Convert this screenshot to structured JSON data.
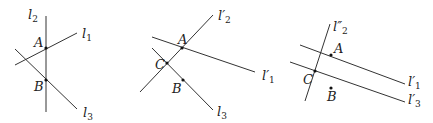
{
  "panels": [
    {
      "id": "panel-1",
      "lines": [
        {
          "name": "l2",
          "label": "l",
          "sub": "2",
          "prime": "",
          "x1": 46,
          "y1": 16,
          "x2": 46,
          "y2": 112,
          "lx": 28,
          "ly": 19
        },
        {
          "name": "l1",
          "label": "l",
          "sub": "1",
          "prime": "",
          "x1": 15,
          "y1": 65,
          "x2": 77,
          "y2": 33,
          "lx": 82,
          "ly": 38
        },
        {
          "name": "l3",
          "label": "l",
          "sub": "3",
          "prime": "",
          "x1": 15,
          "y1": 49,
          "x2": 77,
          "y2": 109,
          "lx": 83,
          "ly": 117
        }
      ],
      "points": [
        {
          "name": "A",
          "x": 46,
          "y": 48,
          "lx": 34,
          "ly": 47,
          "dot": true
        },
        {
          "name": "B",
          "x": 46,
          "y": 80,
          "lx": 34,
          "ly": 91,
          "dot": true
        }
      ]
    },
    {
      "id": "panel-2",
      "lines": [
        {
          "name": "l2-prime",
          "label": "l",
          "sub": "2",
          "prime": "′",
          "x1": 140,
          "y1": 92,
          "x2": 213,
          "y2": 15,
          "lx": 218,
          "ly": 20
        },
        {
          "name": "l1-prime",
          "label": "l",
          "sub": "1",
          "prime": "′",
          "x1": 152,
          "y1": 37,
          "x2": 255,
          "y2": 72,
          "lx": 262,
          "ly": 80
        },
        {
          "name": "l3",
          "label": "l",
          "sub": "3",
          "prime": "",
          "x1": 152,
          "y1": 48,
          "x2": 213,
          "y2": 110,
          "lx": 217,
          "ly": 116
        }
      ],
      "points": [
        {
          "name": "A",
          "x": 182,
          "y": 48,
          "lx": 178,
          "ly": 44,
          "dot": true
        },
        {
          "name": "C",
          "x": 167,
          "y": 63,
          "lx": 155,
          "ly": 69,
          "dot": true
        },
        {
          "name": "B",
          "x": 183,
          "y": 80,
          "lx": 172,
          "ly": 93,
          "dot": true
        }
      ]
    },
    {
      "id": "panel-3",
      "lines": [
        {
          "name": "l2-double-prime",
          "label": "l",
          "sub": "2",
          "prime": "″",
          "x1": 305,
          "y1": 101,
          "x2": 330,
          "y2": 24,
          "lx": 333,
          "ly": 31
        },
        {
          "name": "l1-prime",
          "label": "l",
          "sub": "1",
          "prime": "′",
          "x1": 300,
          "y1": 45,
          "x2": 405,
          "y2": 84,
          "lx": 408,
          "ly": 86
        },
        {
          "name": "l3-prime",
          "label": "l",
          "sub": "3",
          "prime": "′",
          "x1": 290,
          "y1": 62,
          "x2": 405,
          "y2": 102,
          "lx": 408,
          "ly": 104
        }
      ],
      "points": [
        {
          "name": "A",
          "x": 331,
          "y": 55,
          "lx": 334,
          "ly": 53,
          "dot": true
        },
        {
          "name": "C",
          "x": 315,
          "y": 71,
          "lx": 303,
          "ly": 84,
          "dot": true
        },
        {
          "name": "B",
          "x": 331,
          "y": 88,
          "lx": 327,
          "ly": 101,
          "dot": true
        }
      ]
    }
  ]
}
